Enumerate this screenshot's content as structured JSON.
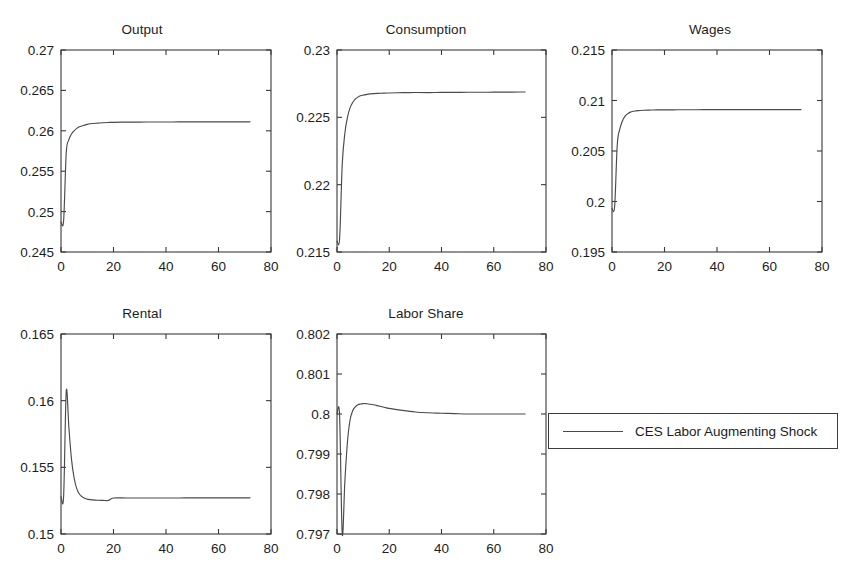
{
  "figure": {
    "background_color": "#ffffff",
    "line_color": "#4a4a4a",
    "axis_color": "#3a3a3a",
    "text_color": "#1d1d1d",
    "width": 852,
    "height": 580
  },
  "legend": {
    "label": "CES Labor Augmenting Shock",
    "position": "right-middle",
    "box": {
      "x": 548,
      "y": 413,
      "width": 290,
      "height": 36
    }
  },
  "chart_data": [
    {
      "type": "line",
      "title": "Output",
      "xlabel": "",
      "ylabel": "",
      "grid": false,
      "xlim": [
        0,
        80
      ],
      "ylim": [
        0.245,
        0.27
      ],
      "xticks": [
        0,
        20,
        40,
        60,
        80
      ],
      "xtick_labels": [
        "0",
        "20",
        "40",
        "60",
        "80"
      ],
      "yticks": [
        0.245,
        0.25,
        0.255,
        0.26,
        0.265,
        0.27
      ],
      "ytick_labels": [
        "0.245",
        "0.25",
        "0.255",
        "0.26",
        "0.265",
        "0.27"
      ],
      "series": [
        {
          "name": "CES Labor Augmenting Shock",
          "x": [
            0,
            1,
            2,
            3,
            4,
            5,
            6,
            7,
            8,
            9,
            10,
            12,
            14,
            16,
            18,
            20,
            25,
            30,
            35,
            40,
            45,
            50,
            55,
            60,
            65,
            70,
            72
          ],
          "values": [
            0.2487,
            0.2489,
            0.2573,
            0.2589,
            0.2596,
            0.26,
            0.2603,
            0.2605,
            0.2606,
            0.2607,
            0.2608,
            0.2609,
            0.26095,
            0.261,
            0.26103,
            0.26105,
            0.26107,
            0.26108,
            0.26109,
            0.26109,
            0.2611,
            0.2611,
            0.2611,
            0.26111,
            0.26111,
            0.26111,
            0.26111
          ]
        }
      ],
      "layout": {
        "x": 0,
        "y": 0,
        "width": 284,
        "height": 290,
        "plot_left": 61,
        "plot_top": 50,
        "plot_right": 271,
        "plot_bottom": 252
      }
    },
    {
      "type": "line",
      "title": "Consumption",
      "xlabel": "",
      "ylabel": "",
      "grid": false,
      "xlim": [
        0,
        80
      ],
      "ylim": [
        0.215,
        0.23
      ],
      "xticks": [
        0,
        20,
        40,
        60,
        80
      ],
      "xtick_labels": [
        "0",
        "20",
        "40",
        "60",
        "80"
      ],
      "yticks": [
        0.215,
        0.22,
        0.225,
        0.23
      ],
      "ytick_labels": [
        "0.215",
        "0.22",
        "0.225",
        "0.23"
      ],
      "series": [
        {
          "name": "CES Labor Augmenting Shock",
          "x": [
            0,
            1,
            2,
            3,
            4,
            5,
            6,
            7,
            8,
            9,
            10,
            12,
            14,
            16,
            18,
            20,
            25,
            30,
            35,
            40,
            45,
            50,
            55,
            60,
            65,
            70,
            72
          ],
          "values": [
            0.2158,
            0.216,
            0.2215,
            0.2238,
            0.225,
            0.2257,
            0.2261,
            0.22635,
            0.2265,
            0.2266,
            0.22665,
            0.22672,
            0.22676,
            0.22678,
            0.2268,
            0.22681,
            0.22683,
            0.22684,
            0.22684,
            0.22685,
            0.22685,
            0.22686,
            0.22686,
            0.22687,
            0.22687,
            0.22688,
            0.22688
          ]
        }
      ],
      "layout": {
        "x": 284,
        "y": 0,
        "width": 284,
        "height": 290,
        "plot_left": 337,
        "plot_top": 50,
        "plot_right": 546,
        "plot_bottom": 252
      }
    },
    {
      "type": "line",
      "title": "Wages",
      "xlabel": "",
      "ylabel": "",
      "grid": false,
      "xlim": [
        0,
        80
      ],
      "ylim": [
        0.195,
        0.215
      ],
      "xticks": [
        0,
        20,
        40,
        60,
        80
      ],
      "xtick_labels": [
        "0",
        "20",
        "40",
        "60",
        "80"
      ],
      "yticks": [
        0.195,
        0.2,
        0.205,
        0.21,
        0.215
      ],
      "ytick_labels": [
        "0.195",
        "0.2",
        "0.205",
        "0.21",
        "0.215"
      ],
      "series": [
        {
          "name": "CES Labor Augmenting Shock",
          "x": [
            0,
            1,
            2,
            3,
            4,
            5,
            6,
            7,
            8,
            9,
            10,
            12,
            14,
            16,
            18,
            20,
            25,
            30,
            35,
            40,
            45,
            50,
            55,
            60,
            65,
            70,
            72
          ],
          "values": [
            0.1993,
            0.1995,
            0.2056,
            0.2072,
            0.208,
            0.20845,
            0.2087,
            0.20885,
            0.20893,
            0.20897,
            0.209,
            0.20903,
            0.20905,
            0.20906,
            0.20907,
            0.20907,
            0.20908,
            0.20908,
            0.20909,
            0.20909,
            0.20909,
            0.20909,
            0.2091,
            0.2091,
            0.2091,
            0.2091,
            0.2091
          ]
        }
      ],
      "layout": {
        "x": 568,
        "y": 0,
        "width": 284,
        "height": 290,
        "plot_left": 612,
        "plot_top": 50,
        "plot_right": 822,
        "plot_bottom": 252
      }
    },
    {
      "type": "line",
      "title": "Rental",
      "xlabel": "",
      "ylabel": "",
      "grid": false,
      "xlim": [
        0,
        80
      ],
      "ylim": [
        0.15,
        0.165
      ],
      "xticks": [
        0,
        20,
        40,
        60,
        80
      ],
      "xtick_labels": [
        "0",
        "20",
        "40",
        "60",
        "80"
      ],
      "yticks": [
        0.15,
        0.155,
        0.16,
        0.165
      ],
      "ytick_labels": [
        "0.15",
        "0.155",
        "0.16",
        "0.165"
      ],
      "series": [
        {
          "name": "CES Labor Augmenting Shock",
          "x": [
            0,
            1,
            2,
            3,
            4,
            5,
            6,
            7,
            8,
            9,
            10,
            12,
            14,
            16,
            18,
            20,
            25,
            30,
            35,
            40,
            45,
            50,
            55,
            60,
            65,
            70,
            72
          ],
          "values": [
            0.1528,
            0.15285,
            0.1607,
            0.158,
            0.1556,
            0.1542,
            0.1534,
            0.153,
            0.1528,
            0.15268,
            0.15262,
            0.15256,
            0.15253,
            0.15252,
            0.15251,
            0.1527,
            0.1527,
            0.1527,
            0.1527,
            0.1527,
            0.1527,
            0.15271,
            0.15271,
            0.15271,
            0.15271,
            0.15271,
            0.15271
          ]
        }
      ],
      "layout": {
        "x": 0,
        "y": 290,
        "width": 284,
        "height": 290,
        "plot_left": 61,
        "plot_top": 334,
        "plot_right": 271,
        "plot_bottom": 534
      }
    },
    {
      "type": "line",
      "title": "Labor Share",
      "xlabel": "",
      "ylabel": "",
      "grid": false,
      "xlim": [
        0,
        80
      ],
      "ylim": [
        0.797,
        0.802
      ],
      "xticks": [
        0,
        20,
        40,
        60,
        80
      ],
      "xtick_labels": [
        "0",
        "20",
        "40",
        "60",
        "80"
      ],
      "yticks": [
        0.797,
        0.798,
        0.799,
        0.8,
        0.801,
        0.802
      ],
      "ytick_labels": [
        "0.797",
        "0.798",
        "0.799",
        "0.8",
        "0.801",
        "0.802"
      ],
      "series": [
        {
          "name": "CES Labor Augmenting Shock",
          "x": [
            0,
            1,
            2,
            3,
            4,
            5,
            6,
            7,
            8,
            9,
            10,
            11,
            12,
            14,
            16,
            18,
            20,
            25,
            30,
            35,
            40,
            45,
            50,
            55,
            60,
            65,
            70,
            72
          ],
          "values": [
            0.8,
            0.79995,
            0.797,
            0.7983,
            0.7993,
            0.79985,
            0.80008,
            0.80018,
            0.80023,
            0.80025,
            0.80026,
            0.80026,
            0.80025,
            0.80023,
            0.8002,
            0.80017,
            0.80014,
            0.80009,
            0.80005,
            0.80003,
            0.80002,
            0.80001,
            0.8,
            0.8,
            0.8,
            0.8,
            0.8,
            0.8
          ]
        }
      ],
      "layout": {
        "x": 284,
        "y": 290,
        "width": 284,
        "height": 290,
        "plot_left": 337,
        "plot_top": 334,
        "plot_right": 546,
        "plot_bottom": 534
      }
    }
  ]
}
